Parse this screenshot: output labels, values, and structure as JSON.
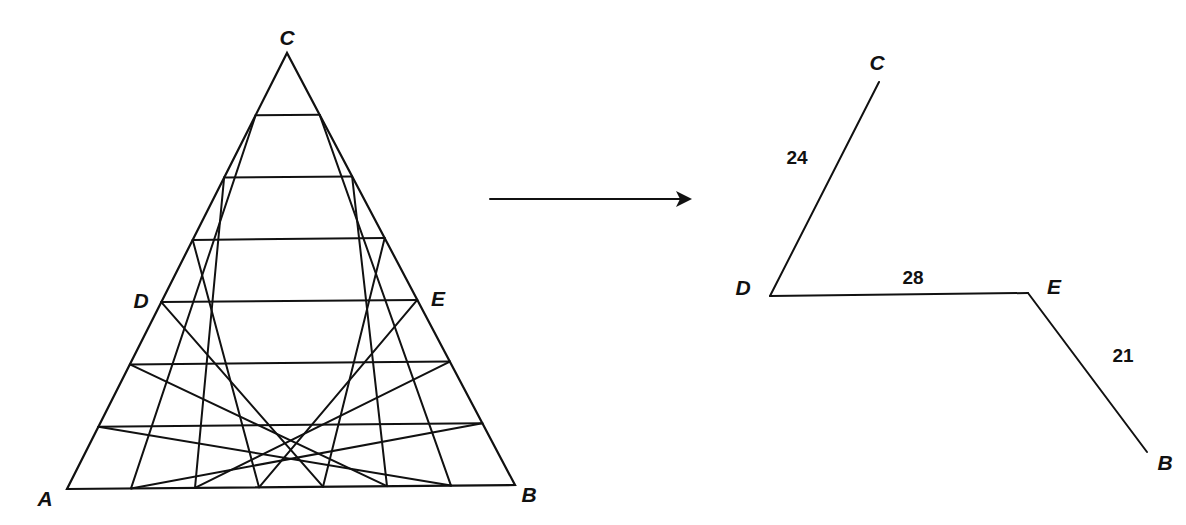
{
  "figure": {
    "left_triangle": {
      "subdivisions": 7,
      "vertices": {
        "A": {
          "label": "A"
        },
        "B": {
          "label": "B"
        },
        "C": {
          "label": "C"
        }
      },
      "side_points": {
        "D": {
          "label": "D",
          "on_side": "AC"
        },
        "E": {
          "label": "E",
          "on_side": "BC"
        }
      }
    },
    "arrow": {
      "direction": "right",
      "icon": "arrow-right-icon"
    },
    "right_path": {
      "points": {
        "C": {
          "label": "C"
        },
        "D": {
          "label": "D"
        },
        "E": {
          "label": "E"
        },
        "B": {
          "label": "B"
        }
      },
      "segments": [
        {
          "from": "D",
          "to": "C",
          "length": "24"
        },
        {
          "from": "D",
          "to": "E",
          "length": "28"
        },
        {
          "from": "E",
          "to": "B",
          "length": "21"
        }
      ]
    }
  }
}
